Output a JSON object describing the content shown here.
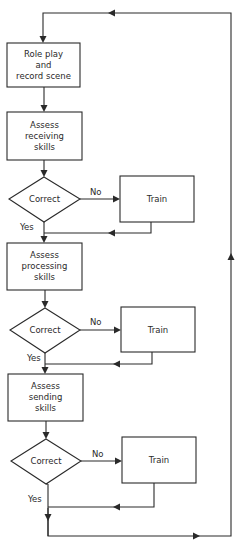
{
  "diagram": {
    "type": "flowchart",
    "nodes": {
      "role_play": {
        "lines": [
          "Role play",
          "and",
          "record scene"
        ]
      },
      "assess_receiving": {
        "lines": [
          "Assess",
          "receiving",
          "skills"
        ]
      },
      "decision_1": {
        "label": "Correct"
      },
      "train_1": {
        "label": "Train"
      },
      "assess_processing": {
        "lines": [
          "Assess",
          "processing",
          "skills"
        ]
      },
      "decision_2": {
        "label": "Correct"
      },
      "train_2": {
        "label": "Train"
      },
      "assess_sending": {
        "lines": [
          "Assess",
          "sending",
          "skills"
        ]
      },
      "decision_3": {
        "label": "Correct"
      },
      "train_3": {
        "label": "Train"
      }
    },
    "edge_labels": {
      "no_1": "No",
      "yes_1": "Yes",
      "no_2": "No",
      "yes_2": "Yes",
      "no_3": "No",
      "yes_3": "Yes"
    },
    "edges": [
      {
        "from": "role_play",
        "to": "assess_receiving"
      },
      {
        "from": "assess_receiving",
        "to": "decision_1"
      },
      {
        "from": "decision_1",
        "to": "train_1",
        "label": "No"
      },
      {
        "from": "decision_1",
        "to": "assess_processing",
        "label": "Yes"
      },
      {
        "from": "train_1",
        "to": "assess_processing"
      },
      {
        "from": "assess_processing",
        "to": "decision_2"
      },
      {
        "from": "decision_2",
        "to": "train_2",
        "label": "No"
      },
      {
        "from": "decision_2",
        "to": "assess_sending",
        "label": "Yes"
      },
      {
        "from": "train_2",
        "to": "assess_sending"
      },
      {
        "from": "assess_sending",
        "to": "decision_3"
      },
      {
        "from": "decision_3",
        "to": "train_3",
        "label": "No"
      },
      {
        "from": "decision_3",
        "to": "loop_back",
        "label": "Yes"
      },
      {
        "from": "train_3",
        "to": "loop_back"
      },
      {
        "from": "loop_back",
        "to": "role_play"
      }
    ],
    "colors": {
      "stroke": "#2a2a2a",
      "background": "#ffffff"
    }
  }
}
